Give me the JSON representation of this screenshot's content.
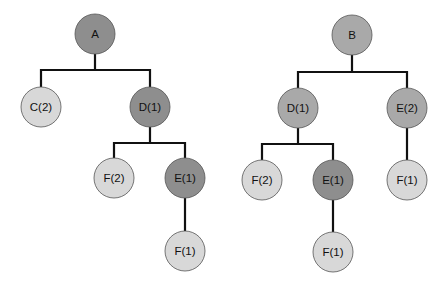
{
  "colors": {
    "dark": "#8e8e8e",
    "medium": "#a9a9a9",
    "light": "#d8d8d8",
    "edge": "#111111"
  },
  "trees": [
    {
      "name": "tree-a",
      "nodes": [
        {
          "id": "a",
          "label": "A",
          "x": 95,
          "y": 34,
          "shade": "dark"
        },
        {
          "id": "c2",
          "label": "C(2)",
          "x": 41,
          "y": 107,
          "shade": "light"
        },
        {
          "id": "d1",
          "label": "D(1)",
          "x": 150,
          "y": 107,
          "shade": "dark"
        },
        {
          "id": "f2",
          "label": "F(2)",
          "x": 114,
          "y": 178,
          "shade": "light"
        },
        {
          "id": "e1",
          "label": "E(1)",
          "x": 185,
          "y": 178,
          "shade": "dark"
        },
        {
          "id": "f1",
          "label": "F(1)",
          "x": 185,
          "y": 251,
          "shade": "light"
        }
      ]
    },
    {
      "name": "tree-b",
      "nodes": [
        {
          "id": "b",
          "label": "B",
          "x": 352,
          "y": 35,
          "shade": "medium"
        },
        {
          "id": "d1",
          "label": "D(1)",
          "x": 298,
          "y": 108,
          "shade": "medium"
        },
        {
          "id": "e2",
          "label": "E(2)",
          "x": 407,
          "y": 108,
          "shade": "medium"
        },
        {
          "id": "f2",
          "label": "F(2)",
          "x": 262,
          "y": 180,
          "shade": "light"
        },
        {
          "id": "e1",
          "label": "E(1)",
          "x": 333,
          "y": 180,
          "shade": "dark"
        },
        {
          "id": "f1b",
          "label": "F(1)",
          "x": 407,
          "y": 180,
          "shade": "light"
        },
        {
          "id": "f1",
          "label": "F(1)",
          "x": 333,
          "y": 252,
          "shade": "light"
        }
      ]
    }
  ]
}
